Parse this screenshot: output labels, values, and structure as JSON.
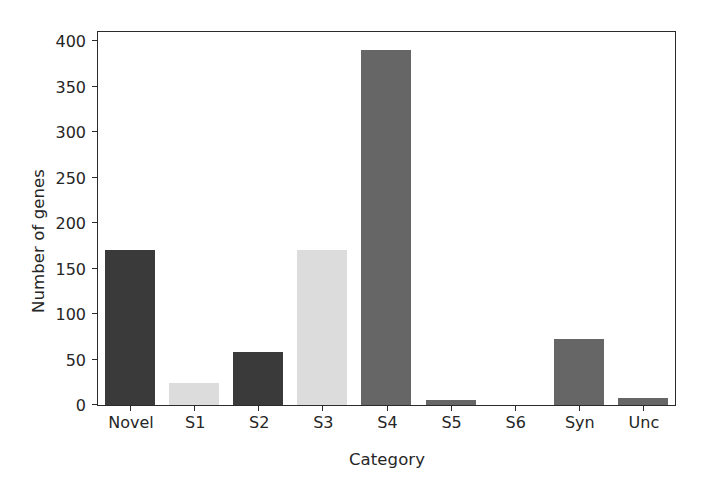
{
  "chart_data": {
    "type": "bar",
    "title": "",
    "subtitle": "",
    "xlabel": "Category",
    "ylabel": "Number of genes",
    "categories": [
      "Novel",
      "S1",
      "S2",
      "S3",
      "S4",
      "S5",
      "S6",
      "Syn",
      "Unc"
    ],
    "values": [
      170,
      24,
      58,
      170,
      390,
      6,
      0,
      73,
      8
    ],
    "bar_colors": [
      "#3a3a3a",
      "#dcdcdc",
      "#3a3a3a",
      "#dcdcdc",
      "#666666",
      "#666666",
      "#666666",
      "#666666",
      "#666666"
    ],
    "ylim": [
      0,
      410
    ],
    "xlim": [
      -0.5,
      8.5
    ],
    "yticks": [
      0,
      50,
      100,
      150,
      200,
      250,
      300,
      350,
      400
    ],
    "ytick_labels": [
      "0",
      "50",
      "100",
      "150",
      "200",
      "250",
      "300",
      "350",
      "400"
    ],
    "grid": false,
    "legend": null,
    "legend_position": "none",
    "annotations": [],
    "axis_color": "#2b2b2b",
    "text_color": "#262626",
    "background": "#ffffff"
  }
}
